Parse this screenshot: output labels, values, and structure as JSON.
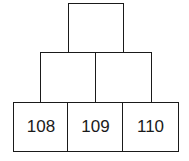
{
  "pyramid": {
    "rows": [
      {
        "cells": [
          {
            "value": ""
          }
        ]
      },
      {
        "cells": [
          {
            "value": ""
          },
          {
            "value": ""
          }
        ]
      },
      {
        "cells": [
          {
            "value": "108"
          },
          {
            "value": "109"
          },
          {
            "value": "110"
          }
        ]
      }
    ]
  }
}
